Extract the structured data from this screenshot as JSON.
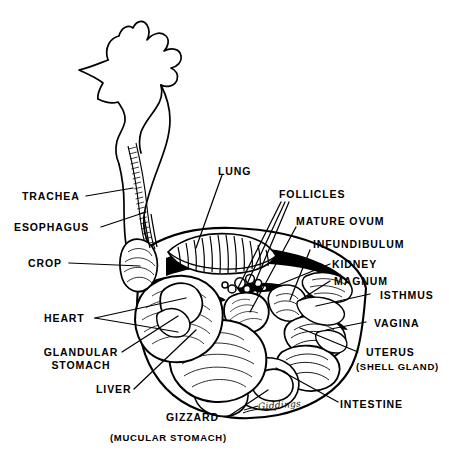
{
  "figure": {
    "artist_signature": "Giddings",
    "ink_color": "#000000",
    "background_color": "#ffffff"
  },
  "labels": {
    "left": [
      {
        "id": "trachea",
        "text": "TRACHEA"
      },
      {
        "id": "esophagus",
        "text": "ESOPHAGUS"
      },
      {
        "id": "crop",
        "text": "CROP"
      },
      {
        "id": "heart",
        "text": "HEART"
      },
      {
        "id": "glandular-stomach-line1",
        "text": "GLANDULAR"
      },
      {
        "id": "glandular-stomach-line2",
        "text": "STOMACH"
      },
      {
        "id": "liver",
        "text": "LIVER"
      }
    ],
    "top": [
      {
        "id": "lung",
        "text": "LUNG"
      },
      {
        "id": "follicles",
        "text": "FOLLICLES"
      }
    ],
    "right": [
      {
        "id": "mature-ovum",
        "text": "MATURE  OVUM"
      },
      {
        "id": "infundibulum",
        "text": "INFUNDIBULUM"
      },
      {
        "id": "kidney",
        "text": "KIDNEY"
      },
      {
        "id": "magnum",
        "text": "MAGNUM"
      },
      {
        "id": "isthmus",
        "text": "ISTHMUS"
      },
      {
        "id": "vagina",
        "text": "VAGINA"
      },
      {
        "id": "uterus",
        "text": "UTERUS"
      },
      {
        "id": "uterus-sub",
        "text": "(SHELL GLAND)"
      },
      {
        "id": "intestine",
        "text": "INTESTINE"
      }
    ],
    "bottom": [
      {
        "id": "gizzard",
        "text": "GIZZARD"
      },
      {
        "id": "gizzard-sub",
        "text": "(MUCULAR  STOMACH)"
      }
    ]
  }
}
